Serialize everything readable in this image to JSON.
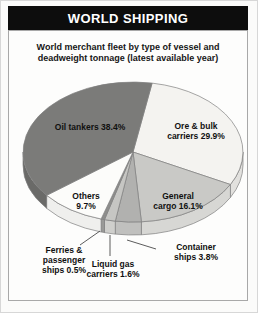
{
  "header": {
    "title": "WORLD SHIPPING"
  },
  "chart_data": {
    "type": "pie",
    "title": "WORLD SHIPPING",
    "subtitle": "World merchant fleet by type of vessel and\ndeadweight tonnage (latest available year)",
    "unit": "percent of deadweight tonnage",
    "direction": "clockwise",
    "slices": [
      {
        "label": "Ore & bulk carriers",
        "value": 29.9,
        "display": "Ore & bulk\ncarriers 29.9%",
        "color": "#f4f3f0",
        "rim": "#e2e1de"
      },
      {
        "label": "General cargo",
        "value": 16.1,
        "display": "General\ncargo 16.1%",
        "color": "#c9c9c6",
        "rim": "#d7d7d4"
      },
      {
        "label": "Container ships",
        "value": 3.8,
        "display": "Container\nships 3.8%",
        "color": "#b1b1af",
        "rim": "#c0c0be"
      },
      {
        "label": "Liquid gas carriers",
        "value": 1.6,
        "display": "Liquid gas\ncarriers 1.6%",
        "color": "#c6c6c3",
        "rim": "#cfcfcc"
      },
      {
        "label": "Ferries & passenger ships",
        "value": 0.5,
        "display": "Ferries &\npassenger\nships 0.5%",
        "color": "#8e8e8c",
        "rim": "#999997"
      },
      {
        "label": "Others",
        "value": 9.7,
        "display": "Others\n9.7%",
        "color": "#fcfcfa",
        "rim": "#efefed"
      },
      {
        "label": "Oil tankers",
        "value": 38.4,
        "display": "Oil tankers 38.4%",
        "color": "#7b7b79",
        "rim": "#6a6a68"
      }
    ],
    "colors": {
      "header_bg": "#0d0d0d",
      "header_text": "#ffffff",
      "outline": "#7f7f7f",
      "text": "#101010",
      "panel_border": "#a8a8a8"
    }
  }
}
